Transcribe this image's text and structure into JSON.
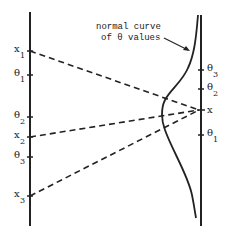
{
  "diagram": {
    "annotation": {
      "line1": "normal curve",
      "line2": "of θ values"
    },
    "left_axis": {
      "ticks": [
        {
          "base": "x",
          "sub": "1",
          "y": 51
        },
        {
          "base": "θ",
          "sub": "1",
          "y": 75
        },
        {
          "base": "θ",
          "sub": "2",
          "y": 117
        },
        {
          "base": "x",
          "sub": "2",
          "y": 137
        },
        {
          "base": "θ",
          "sub": "3",
          "y": 157
        },
        {
          "base": "x",
          "sub": "3",
          "y": 196
        }
      ]
    },
    "right_axis": {
      "ticks": [
        {
          "base": "θ",
          "sub": "3",
          "y": 70
        },
        {
          "base": "θ",
          "sub": "2",
          "y": 89
        },
        {
          "base": "x",
          "sub": "",
          "y": 110
        },
        {
          "base": "θ",
          "sub": "1",
          "y": 135
        }
      ]
    },
    "connections": [
      {
        "from": "x1",
        "to": "x"
      },
      {
        "from": "x2",
        "to": "x"
      },
      {
        "from": "x3",
        "to": "x"
      }
    ],
    "colors": {
      "ink": "#222222",
      "background": "#ffffff"
    }
  }
}
